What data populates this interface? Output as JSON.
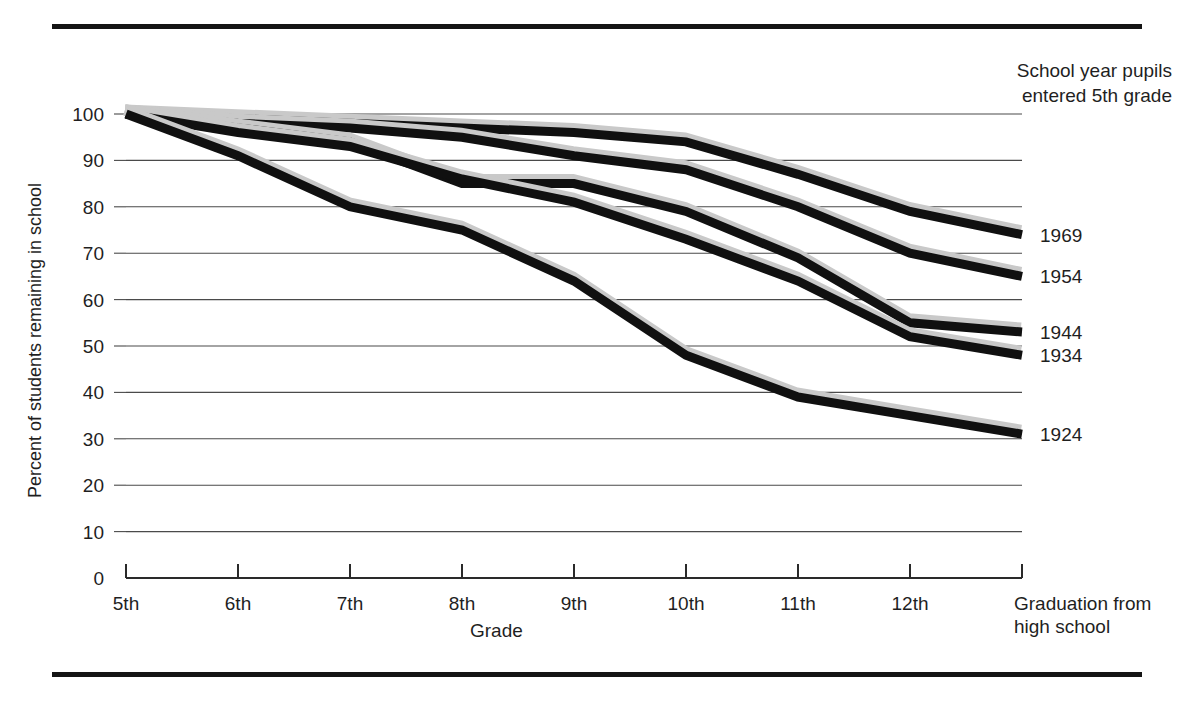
{
  "legend": {
    "title": "School year pupils\nentered 5th grade"
  },
  "axes": {
    "ylabel": "Percent of students remaining in school",
    "xlabel": "Grade",
    "yticks": [
      "100",
      "90",
      "80",
      "70",
      "60",
      "50",
      "40",
      "30",
      "20",
      "10",
      "0"
    ],
    "xticks": [
      "5th",
      "6th",
      "7th",
      "8th",
      "9th",
      "10th",
      "11th",
      "12th",
      "Graduation from\nhigh school"
    ]
  },
  "series_labels": [
    "1969",
    "1954",
    "1944",
    "1934",
    "1924"
  ],
  "colors": {
    "line": "#101010",
    "line_shadow": "#c9c9c9",
    "grid": "#4a4a4a",
    "axis": "#2a2a2a",
    "text": "#1f1f1f",
    "rule": "#141414"
  },
  "chart_data": {
    "type": "line",
    "title": "",
    "xlabel": "Grade",
    "ylabel": "Percent of students remaining in school",
    "categories": [
      "5th",
      "6th",
      "7th",
      "8th",
      "9th",
      "10th",
      "11th",
      "12th",
      "Graduation from high school"
    ],
    "ylim": [
      0,
      100
    ],
    "yticks": [
      0,
      10,
      20,
      30,
      40,
      50,
      60,
      70,
      80,
      90,
      100
    ],
    "grid": true,
    "legend": "right-of-line-ends",
    "legend_title": "School year pupils entered 5th grade",
    "series": [
      {
        "name": "1969",
        "values": [
          100,
          99,
          98,
          97,
          96,
          94,
          87,
          79,
          74
        ]
      },
      {
        "name": "1954",
        "values": [
          100,
          98,
          97,
          95,
          91,
          88,
          80,
          70,
          65
        ]
      },
      {
        "name": "1944",
        "values": [
          100,
          97,
          94,
          85,
          85,
          79,
          69,
          55,
          53
        ]
      },
      {
        "name": "1934",
        "values": [
          100,
          96,
          93,
          86,
          81,
          73,
          64,
          52,
          48
        ]
      },
      {
        "name": "1924",
        "values": [
          100,
          91,
          80,
          75,
          64,
          48,
          39,
          35,
          31
        ]
      }
    ]
  }
}
